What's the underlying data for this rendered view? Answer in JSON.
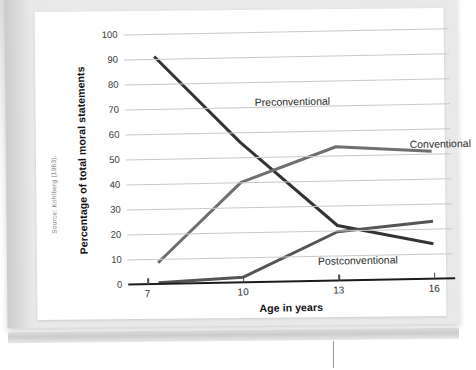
{
  "figure": {
    "source_note": "Source: Kohlberg (1963).",
    "background_color": "#ffffff",
    "page_color": "#e9e9e9"
  },
  "chart_data": {
    "type": "line",
    "title": "",
    "xlabel": "Age in years",
    "ylabel": "Percentage of total moral statements",
    "x": [
      7,
      10,
      13,
      16
    ],
    "xlim": [
      6.4,
      16.6
    ],
    "ylim": [
      0,
      100
    ],
    "xticks": [
      "7",
      "10",
      "13",
      "16"
    ],
    "yticks": [
      "0",
      "10",
      "20",
      "30",
      "40",
      "50",
      "60",
      "70",
      "80",
      "90",
      "100"
    ],
    "grid": "horizontal",
    "legend_position": "inline-labels",
    "series": [
      {
        "name": "Preconventional",
        "color": "#333333",
        "values": [
          91,
          56,
          22,
          14
        ],
        "x_start_offset": 7.35,
        "label_x": 180,
        "label_y": 78
      },
      {
        "name": "Conventional",
        "color": "#6f6f6f",
        "values": [
          8.5,
          40,
          53.5,
          51
        ],
        "x_start_offset": 7.35,
        "label_x": 334,
        "label_y": 123
      },
      {
        "name": "Postconventional",
        "color": "#555555",
        "values": [
          0.5,
          2,
          19.5,
          23
        ],
        "x_start_offset": 7.35,
        "label_x": 240,
        "label_y": 238
      }
    ],
    "annotations": [
      "Preconventional declines sharply with age",
      "Conventional rises then plateaus",
      "Postconventional rises slowly after age 10"
    ]
  }
}
